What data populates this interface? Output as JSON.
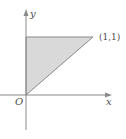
{
  "diagram": {
    "type": "region-plot",
    "axes": {
      "x_label": "x",
      "y_label": "y",
      "origin_label": "O"
    },
    "region": {
      "shape": "triangle",
      "vertices": [
        [
          0,
          0
        ],
        [
          0,
          1
        ],
        [
          1,
          1
        ]
      ],
      "fill_color": "#d9d9d9",
      "edge_color": "#8a8a8a"
    },
    "point_label": "(1,1)",
    "axis_color": "#8a8a8a"
  }
}
